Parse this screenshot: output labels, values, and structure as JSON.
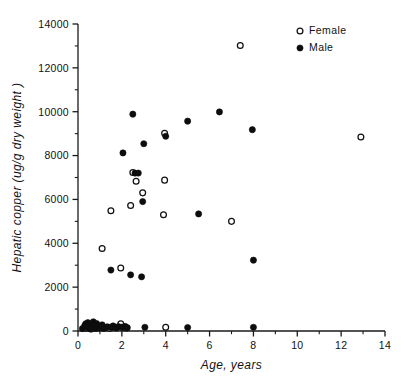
{
  "chart_data": {
    "type": "scatter",
    "title": "",
    "xlabel": "Age,  years",
    "ylabel": "Hepatic copper (ug/g dry weight )",
    "xlim": [
      0,
      14
    ],
    "ylim": [
      0,
      14000
    ],
    "grid": false,
    "legend_position": "top-right",
    "x_ticks_major": [
      0,
      2,
      4,
      6,
      8,
      10,
      12,
      14
    ],
    "x_tick_labels": [
      "0",
      "2",
      "4",
      "6",
      "8",
      "10",
      "12",
      "14"
    ],
    "x_ticks_minor": [
      1,
      3,
      5,
      7,
      9,
      11,
      13
    ],
    "y_ticks_major": [
      0,
      2000,
      4000,
      6000,
      8000,
      10000,
      12000,
      14000
    ],
    "y_tick_labels": [
      "0",
      "2000",
      "4000",
      "6000",
      "8000",
      "10000",
      "12000",
      "14000"
    ],
    "y_ticks_minor": [
      1000,
      3000,
      5000,
      7000,
      9000,
      11000,
      13000
    ],
    "series": [
      {
        "name": "Female",
        "marker": "open-circle",
        "color": "#111111",
        "points": [
          [
            0.35,
            120
          ],
          [
            0.5,
            150
          ],
          [
            0.6,
            90
          ],
          [
            0.75,
            180
          ],
          [
            0.9,
            140
          ],
          [
            1.05,
            200
          ],
          [
            1.15,
            130
          ],
          [
            1.3,
            170
          ],
          [
            1.45,
            110
          ],
          [
            1.6,
            190
          ],
          [
            1.75,
            150
          ],
          [
            1.95,
            330
          ],
          [
            2.05,
            170
          ],
          [
            2.2,
            140
          ],
          [
            1.1,
            3760
          ],
          [
            1.5,
            5480
          ],
          [
            1.95,
            2870
          ],
          [
            2.4,
            5720
          ],
          [
            2.5,
            7230
          ],
          [
            2.65,
            6830
          ],
          [
            2.95,
            6300
          ],
          [
            3.95,
            9020
          ],
          [
            3.95,
            6880
          ],
          [
            3.9,
            5300
          ],
          [
            4.0,
            170
          ],
          [
            7.0,
            5000
          ],
          [
            7.4,
            13020
          ],
          [
            12.9,
            8850
          ]
        ]
      },
      {
        "name": "Male",
        "marker": "filled-circle",
        "color": "#0d0d0d",
        "points": [
          [
            0.2,
            110
          ],
          [
            0.3,
            230
          ],
          [
            0.35,
            330
          ],
          [
            0.4,
            160
          ],
          [
            0.45,
            380
          ],
          [
            0.5,
            260
          ],
          [
            0.55,
            100
          ],
          [
            0.6,
            310
          ],
          [
            0.65,
            190
          ],
          [
            0.7,
            420
          ],
          [
            0.75,
            250
          ],
          [
            0.8,
            120
          ],
          [
            0.85,
            340
          ],
          [
            0.9,
            210
          ],
          [
            1.0,
            150
          ],
          [
            1.1,
            280
          ],
          [
            1.2,
            130
          ],
          [
            1.35,
            190
          ],
          [
            1.5,
            160
          ],
          [
            1.6,
            230
          ],
          [
            1.75,
            140
          ],
          [
            1.85,
            200
          ],
          [
            2.0,
            170
          ],
          [
            2.15,
            210
          ],
          [
            2.25,
            150
          ],
          [
            1.5,
            2780
          ],
          [
            2.4,
            2560
          ],
          [
            2.5,
            9890
          ],
          [
            2.6,
            7200
          ],
          [
            2.9,
            2470
          ],
          [
            2.95,
            5900
          ],
          [
            3.0,
            8540
          ],
          [
            3.05,
            170
          ],
          [
            2.05,
            8120
          ],
          [
            2.75,
            7200
          ],
          [
            4.0,
            8880
          ],
          [
            5.0,
            9570
          ],
          [
            5.0,
            160
          ],
          [
            5.5,
            5340
          ],
          [
            6.45,
            9990
          ],
          [
            7.95,
            9180
          ],
          [
            8.0,
            3230
          ],
          [
            8.0,
            170
          ]
        ]
      }
    ]
  },
  "legend": {
    "entries": [
      {
        "label": "Female",
        "marker": "open-circle"
      },
      {
        "label": "Male",
        "marker": "filled-circle"
      }
    ]
  }
}
